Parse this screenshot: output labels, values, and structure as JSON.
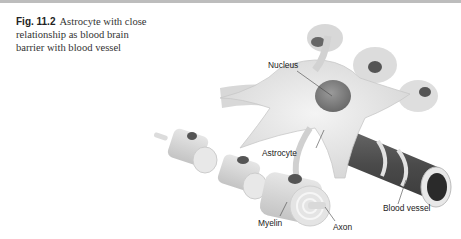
{
  "caption": {
    "figure_number": "Fig. 11.2",
    "text": "Astrocyte with close relationship as blood brain barrier with blood vessel"
  },
  "figure": {
    "labels": {
      "nucleus": "Nucleus",
      "astrocyte": "Astrocyte",
      "blood_vessel": "Blood vessel",
      "myelin": "Myelin",
      "axon": "Axon"
    }
  }
}
